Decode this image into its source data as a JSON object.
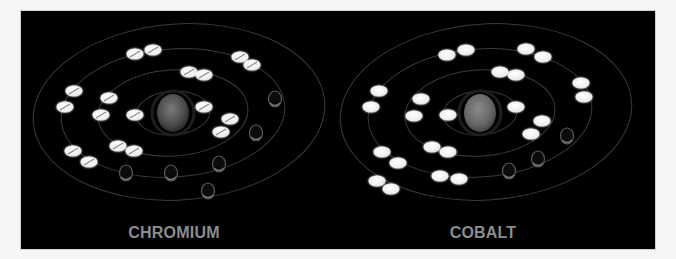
{
  "figure": {
    "background": "#000000",
    "orbit_color": "#3a3a3a",
    "electron_color": "#f2f2f2",
    "ghost_color": "#5a5a5a"
  },
  "atoms": [
    {
      "name": "CHROMIUM",
      "label": "CHROMIUM",
      "nucleus": {
        "cx": 152,
        "cy": 102,
        "rx": 16,
        "ry": 19,
        "color": "#5e5e5e"
      },
      "shells": [
        {
          "cx": 152,
          "cy": 102,
          "rx": 37,
          "ry": 22
        },
        {
          "cx": 152,
          "cy": 102,
          "rx": 75,
          "ry": 43
        },
        {
          "cx": 152,
          "cy": 102,
          "rx": 112,
          "ry": 64
        },
        {
          "cx": 158,
          "cy": 101,
          "rx": 146,
          "ry": 88
        }
      ],
      "electrons": [
        [
          114,
          43
        ],
        [
          132,
          39
        ],
        [
          168,
          61
        ],
        [
          183,
          64
        ],
        [
          219,
          46
        ],
        [
          231,
          54
        ],
        [
          53,
          80
        ],
        [
          44,
          96
        ],
        [
          88,
          87
        ],
        [
          80,
          104
        ],
        [
          114,
          104
        ],
        [
          183,
          96
        ],
        [
          209,
          108
        ],
        [
          200,
          121
        ],
        [
          97,
          135
        ],
        [
          113,
          140
        ],
        [
          52,
          140
        ],
        [
          68,
          151
        ]
      ],
      "ghost_electrons": [
        [
          254,
          88
        ],
        [
          235,
          122
        ],
        [
          198,
          153
        ],
        [
          150,
          162
        ],
        [
          105,
          162
        ],
        [
          187,
          180
        ]
      ],
      "electron_count_shown": 18,
      "has_split_markers": true
    },
    {
      "name": "COBALT",
      "label": "COBALT",
      "nucleus": {
        "cx": 459,
        "cy": 102,
        "rx": 16,
        "ry": 19,
        "color": "#6a6a6a"
      },
      "shells": [
        {
          "cx": 459,
          "cy": 102,
          "rx": 37,
          "ry": 22
        },
        {
          "cx": 459,
          "cy": 102,
          "rx": 75,
          "ry": 43
        },
        {
          "cx": 459,
          "cy": 102,
          "rx": 112,
          "ry": 64
        },
        {
          "cx": 465,
          "cy": 101,
          "rx": 146,
          "ry": 88
        }
      ],
      "electrons": [
        [
          426,
          44
        ],
        [
          445,
          39
        ],
        [
          505,
          38
        ],
        [
          522,
          46
        ],
        [
          479,
          61
        ],
        [
          495,
          64
        ],
        [
          560,
          72
        ],
        [
          563,
          86
        ],
        [
          358,
          80
        ],
        [
          350,
          96
        ],
        [
          400,
          88
        ],
        [
          393,
          105
        ],
        [
          427,
          104
        ],
        [
          495,
          96
        ],
        [
          521,
          110
        ],
        [
          510,
          123
        ],
        [
          411,
          136
        ],
        [
          427,
          141
        ],
        [
          361,
          141
        ],
        [
          377,
          152
        ],
        [
          419,
          165
        ],
        [
          438,
          168
        ],
        [
          356,
          170
        ],
        [
          370,
          178
        ]
      ],
      "ghost_electrons": [
        [
          546,
          125
        ],
        [
          517,
          148
        ],
        [
          488,
          160
        ]
      ],
      "electron_count_shown": 24,
      "has_split_markers": false
    }
  ]
}
